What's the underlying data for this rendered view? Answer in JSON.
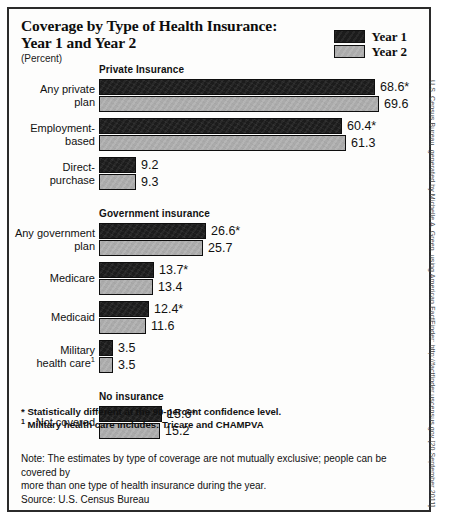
{
  "title": {
    "line1": "Coverage by Type of Health Insurance:",
    "line2": "Year 1 and Year 2",
    "subtitle": "(Percent)"
  },
  "legend": {
    "position": "top-right",
    "items": [
      {
        "label": "Year 1",
        "color": "#1c1c1c"
      },
      {
        "label": "Year 2",
        "color": "#ababab"
      }
    ]
  },
  "footnotes": {
    "asterisk": "* Statistically different at the 90-percent confidence level.",
    "dagger_marker": "1",
    "dagger": " Military health care includes: Tricare and CHAMPVA"
  },
  "notes": {
    "note_line1": "Note:  The estimates by type of coverage are not mutually exclusive; people can be covered by",
    "note_line2": "more than one type of health insurance during the year.",
    "source": "Source: U.S. Census Bureau"
  },
  "credit": "U.S. Census Bureau, generated by Michelle A. Green, using American FactFinder; http://factfinder.uscensus.gov [20 September 2011]",
  "chart_data": {
    "type": "bar",
    "orientation": "horizontal",
    "title": "Coverage by Type of Health Insurance: Year 1 and Year 2",
    "xlabel": "",
    "ylabel": "",
    "unit": "Percent",
    "xlim": [
      0,
      72
    ],
    "grid": false,
    "legend_position": "top-right",
    "series": [
      {
        "name": "Year 1",
        "color": "#1c1c1c"
      },
      {
        "name": "Year 2",
        "color": "#ababab"
      }
    ],
    "groups": [
      {
        "group_label": "Private Insurance",
        "categories": [
          {
            "label_line1": "Any private",
            "label_line2": "plan",
            "label_sup": "",
            "values": [
              68.6,
              69.6
            ],
            "value_labels": [
              "68.6*",
              "69.6"
            ]
          },
          {
            "label_line1": "Employment-",
            "label_line2": "based",
            "label_sup": "",
            "values": [
              60.4,
              61.3
            ],
            "value_labels": [
              "60.4*",
              "61.3"
            ]
          },
          {
            "label_line1": "Direct-",
            "label_line2": "purchase",
            "label_sup": "",
            "values": [
              9.2,
              9.3
            ],
            "value_labels": [
              "9.2",
              "9.3"
            ]
          }
        ]
      },
      {
        "group_label": "Government insurance",
        "categories": [
          {
            "label_line1": "Any government",
            "label_line2": "plan",
            "label_sup": "",
            "values": [
              26.6,
              25.7
            ],
            "value_labels": [
              "26.6*",
              "25.7"
            ]
          },
          {
            "label_line1": "Medicare",
            "label_line2": "",
            "label_sup": "",
            "values": [
              13.7,
              13.4
            ],
            "value_labels": [
              "13.7*",
              "13.4"
            ]
          },
          {
            "label_line1": "Medicaid",
            "label_line2": "",
            "label_sup": "",
            "values": [
              12.4,
              11.6
            ],
            "value_labels": [
              "12.4*",
              "11.6"
            ]
          },
          {
            "label_line1": "Military",
            "label_line2": "health care",
            "label_sup": "1",
            "values": [
              3.5,
              3.5
            ],
            "value_labels": [
              "3.5",
              "3.5"
            ]
          }
        ]
      },
      {
        "group_label": "No insurance",
        "categories": [
          {
            "label_line1": "Not covered",
            "label_line2": "",
            "label_sup": "",
            "values": [
              15.6,
              15.2
            ],
            "value_labels": [
              "15.6*",
              "15.2"
            ]
          }
        ]
      }
    ]
  }
}
